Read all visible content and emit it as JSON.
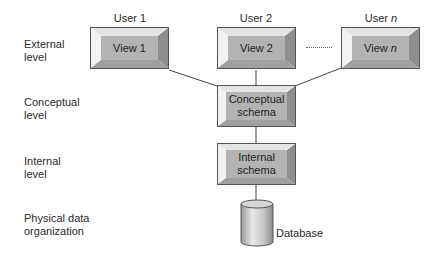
{
  "diagram": {
    "levels": [
      {
        "id": "external",
        "label": "External\nlevel"
      },
      {
        "id": "conceptual",
        "label": "Conceptual\nlevel"
      },
      {
        "id": "internal",
        "label": "Internal\nlevel"
      },
      {
        "id": "physical",
        "label": "Physical data\norganization"
      }
    ],
    "users": [
      {
        "label": "User 1",
        "view": "View 1"
      },
      {
        "label": "User 2",
        "view": "View 2"
      },
      {
        "label": "User n",
        "view": "View n"
      }
    ],
    "ellipsis": "........",
    "conceptual_schema": "Conceptual\nschema",
    "internal_schema": "Internal\nschema",
    "database": "Database",
    "colors": {
      "box_face": "#b3b3b3",
      "bevel_light": "#e6e6e6",
      "bevel_dark": "#8c8c8c",
      "line": "#444444"
    }
  }
}
